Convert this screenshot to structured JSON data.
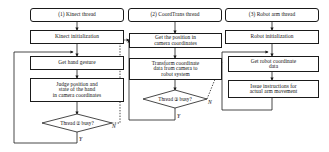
{
  "diagram": {
    "type": "flowchart",
    "background_color": "#ffffff",
    "line_color": "#1a1a1a",
    "columns": [
      {
        "id": "col1",
        "header": "(1) Kinect thread",
        "steps": [
          "Kinect initialization",
          "Get hand gesture",
          "Judge position and\nstate of the hand\nin camera coordinates"
        ],
        "decision": "Thread ② busy?",
        "branch_yes": "Y",
        "branch_no": "N"
      },
      {
        "id": "col2",
        "header": "(2) CoordTrans  thread",
        "steps": [
          "Get the position in\ncamera coordinates",
          "Transform coordinate\ndata from camera to\nrobot system"
        ],
        "decision": "Thread ③ busy?",
        "branch_yes": "Y",
        "branch_no": "N"
      },
      {
        "id": "col3",
        "header": "(3) Robot arm thread",
        "steps": [
          "Robot initialization",
          "Get robot coordinate\ndata",
          "Issue instructions for\nactual arm movement"
        ]
      }
    ]
  }
}
